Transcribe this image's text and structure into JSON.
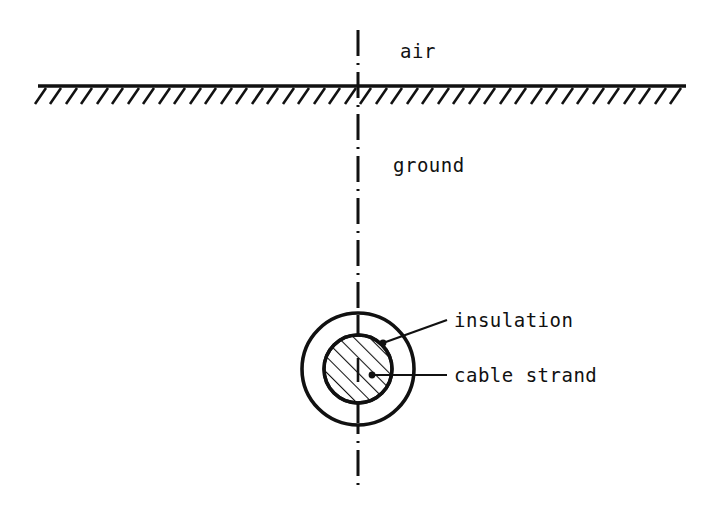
{
  "figure": {
    "kind": "technical-line-diagram",
    "background_color": "#ffffff",
    "ink_color": "#111111"
  },
  "labels": {
    "air": "air",
    "ground": "ground",
    "insulation": "insulation",
    "cable_strand": "cable strand"
  },
  "elements": {
    "ground_line": {
      "name": "ground-surface-line",
      "x_start": 38,
      "x_end": 686,
      "y": 86,
      "hatch_count": 42,
      "hatch_length": 17,
      "hatch_angle_deg": 55
    },
    "centerline": {
      "name": "vertical-centerline",
      "x": 358,
      "y_top": 30,
      "y_bottom": 488,
      "style": "dash-dot"
    },
    "outer_circle": {
      "name": "insulation-circle",
      "cx": 358,
      "cy": 369,
      "r": 56
    },
    "inner_circle": {
      "name": "cable-strand-circle",
      "cx": 358,
      "cy": 369,
      "r": 34,
      "fill": "diagonal-hatch",
      "hatch_angle_deg": 45
    },
    "leader_insulation": {
      "name": "insulation-leader-line",
      "dot_x": 383,
      "dot_y": 343,
      "elbow_x": 447,
      "elbow_y": 320
    },
    "leader_cable_strand": {
      "name": "cable-strand-leader-line",
      "dot_x": 372,
      "dot_y": 375,
      "elbow_x": 447,
      "elbow_y": 375
    }
  },
  "text_positions": {
    "air": {
      "x": 400,
      "y": 58
    },
    "ground": {
      "x": 393,
      "y": 172
    },
    "insulation": {
      "x": 454,
      "y": 327
    },
    "cable_strand": {
      "x": 454,
      "y": 382
    }
  }
}
